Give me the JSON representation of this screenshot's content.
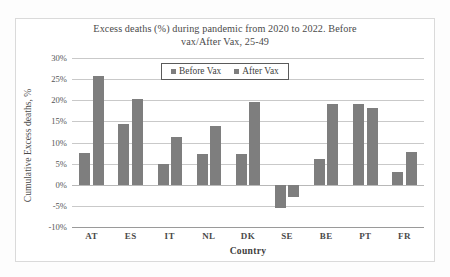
{
  "chart_data": {
    "type": "bar",
    "title": "Excess deaths (%) during pandemic  from 2020 to 2022. Before vax/After Vax, 25-49",
    "title_line1": "Excess  deaths (%) during pandemic  from 2020 to 2022. Before",
    "title_line2": "vax/After Vax, 25-49",
    "xlabel": "Country",
    "ylabel": "Cumulative Excess deaths, %",
    "categories": [
      "AT",
      "ES",
      "IT",
      "NL",
      "DK",
      "SE",
      "BE",
      "PT",
      "FR"
    ],
    "series": [
      {
        "name": "Before Vax",
        "color": "#7e7e7e",
        "values": [
          7.5,
          14.3,
          5.0,
          7.2,
          7.3,
          -5.4,
          6.1,
          19.2,
          3.0
        ]
      },
      {
        "name": "After Vax",
        "color": "#7e7e7e",
        "values": [
          25.8,
          20.3,
          11.3,
          14.0,
          19.6,
          -2.8,
          19.0,
          18.2,
          7.7
        ]
      }
    ],
    "ylim": [
      -10,
      30
    ],
    "ytick_values": [
      30,
      25,
      20,
      15,
      10,
      5,
      0,
      -5,
      -10
    ],
    "ytick_labels": [
      "30%",
      "25%",
      "20%",
      "15%",
      "10%",
      "5%",
      "0%",
      "-5%",
      "-10%"
    ],
    "grid": true,
    "legend_position": "top-center",
    "legend_entries": [
      "Before Vax",
      "After Vax"
    ]
  }
}
